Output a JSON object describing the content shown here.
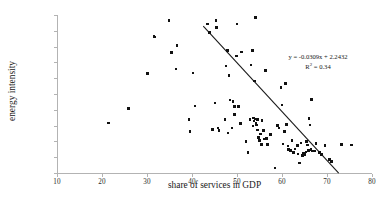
{
  "chart_data": {
    "type": "scatter",
    "title": "",
    "xlabel": "share of services in GDP",
    "ylabel": "energy intensity",
    "xlim": [
      10,
      80
    ],
    "ylim": [
      0.0,
      1.0
    ],
    "xticks": [
      "10",
      "20",
      "30",
      "40",
      "50",
      "60",
      "70",
      "80"
    ],
    "xtick_values": [
      10,
      20,
      30,
      40,
      50,
      60,
      70,
      80
    ],
    "yticks": [
      "0.0",
      "0.1",
      "0.2",
      "0.3",
      "0.4",
      "0.5",
      "0.6",
      "0.7",
      "0.8",
      "0.9",
      "1.0"
    ],
    "ytick_values": [
      0.0,
      0.1,
      0.2,
      0.3,
      0.4,
      0.5,
      0.6,
      0.7,
      0.8,
      0.9,
      1.0
    ],
    "grid": false,
    "legend": "none",
    "marker_color": "#111111",
    "axis_color": "#b3b3b3",
    "trendline": {
      "equation_text": "y = -0.0309x + 2.2432",
      "r2_prefix": "R",
      "r2_exponent": "2",
      "r2_text": " = 0.34",
      "slope": -0.0309,
      "intercept": 2.2432,
      "r_squared": 0.34,
      "x_start": 42.5,
      "x_end": 72.6,
      "color": "#1a1a1a"
    },
    "points": [
      [
        21.5,
        0.317
      ],
      [
        25.9,
        0.407
      ],
      [
        30.1,
        0.631
      ],
      [
        31.6,
        0.866
      ],
      [
        31.7,
        0.862
      ],
      [
        34.9,
        0.966
      ],
      [
        35.5,
        0.762
      ],
      [
        36.4,
        0.659
      ],
      [
        36.7,
        0.806
      ],
      [
        39.3,
        0.34
      ],
      [
        39.6,
        0.264
      ],
      [
        40.2,
        0.632
      ],
      [
        40.7,
        0.425
      ],
      [
        43.4,
        0.943
      ],
      [
        43.9,
        0.889
      ],
      [
        44.5,
        0.274
      ],
      [
        45.1,
        0.444
      ],
      [
        45.3,
        0.966
      ],
      [
        45.5,
        0.922
      ],
      [
        45.8,
        0.285
      ],
      [
        46.0,
        0.27
      ],
      [
        47.3,
        0.34
      ],
      [
        47.6,
        0.678
      ],
      [
        47.9,
        0.776
      ],
      [
        48.0,
        0.254
      ],
      [
        48.2,
        0.617
      ],
      [
        48.4,
        0.463
      ],
      [
        48.9,
        0.286
      ],
      [
        49.1,
        0.451
      ],
      [
        49.4,
        0.369
      ],
      [
        49.5,
        0.421
      ],
      [
        49.9,
        0.74
      ],
      [
        50.0,
        0.944
      ],
      [
        50.3,
        0.42
      ],
      [
        50.8,
        0.313
      ],
      [
        51.0,
        0.766
      ],
      [
        52.0,
        0.2
      ],
      [
        52.4,
        0.128
      ],
      [
        52.9,
        0.338
      ],
      [
        53.1,
        0.683
      ],
      [
        53.4,
        0.776
      ],
      [
        53.6,
        0.297
      ],
      [
        53.7,
        0.349
      ],
      [
        53.8,
        0.33
      ],
      [
        53.9,
        0.582
      ],
      [
        54.0,
        0.342
      ],
      [
        54.1,
        0.985
      ],
      [
        54.2,
        0.316
      ],
      [
        54.3,
        0.303
      ],
      [
        54.5,
        0.271
      ],
      [
        54.6,
        0.338
      ],
      [
        54.8,
        0.225
      ],
      [
        55.0,
        0.206
      ],
      [
        55.2,
        0.248
      ],
      [
        55.4,
        0.182
      ],
      [
        55.6,
        0.333
      ],
      [
        55.9,
        0.27
      ],
      [
        56.0,
        0.215
      ],
      [
        56.3,
        0.65
      ],
      [
        56.5,
        0.218
      ],
      [
        56.8,
        0.18
      ],
      [
        57.4,
        0.245
      ],
      [
        58.4,
        0.032
      ],
      [
        59.0,
        0.302
      ],
      [
        59.3,
        0.286
      ],
      [
        59.8,
        0.54
      ],
      [
        60.0,
        0.43
      ],
      [
        60.2,
        0.183
      ],
      [
        60.5,
        0.262
      ],
      [
        60.8,
        0.568
      ],
      [
        61.0,
        0.307
      ],
      [
        61.3,
        0.172
      ],
      [
        61.5,
        0.148
      ],
      [
        61.9,
        0.143
      ],
      [
        62.2,
        0.205
      ],
      [
        62.5,
        0.131
      ],
      [
        62.9,
        0.153
      ],
      [
        63.4,
        0.175
      ],
      [
        63.6,
        0.121
      ],
      [
        63.9,
        0.063
      ],
      [
        64.2,
        0.19
      ],
      [
        64.5,
        0.112
      ],
      [
        64.8,
        0.124
      ],
      [
        65.0,
        0.118
      ],
      [
        65.3,
        0.133
      ],
      [
        65.5,
        0.2
      ],
      [
        65.7,
        0.177
      ],
      [
        65.9,
        0.143
      ],
      [
        66.0,
        0.344
      ],
      [
        66.2,
        0.305
      ],
      [
        66.4,
        0.148
      ],
      [
        66.6,
        0.466
      ],
      [
        66.8,
        0.138
      ],
      [
        67.2,
        0.14
      ],
      [
        67.6,
        0.186
      ],
      [
        68.3,
        0.128
      ],
      [
        68.8,
        0.116
      ],
      [
        69.6,
        0.175
      ],
      [
        70.5,
        0.085
      ],
      [
        71.0,
        0.073
      ],
      [
        73.2,
        0.181
      ],
      [
        75.4,
        0.178
      ]
    ]
  }
}
